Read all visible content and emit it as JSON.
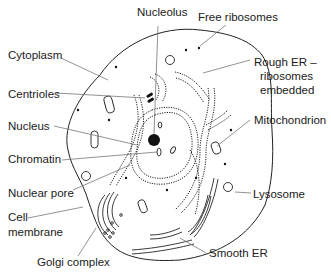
{
  "diagram": {
    "labels": {
      "nucleolus": "Nucleolus",
      "free_ribosomes": "Free ribosomes",
      "cytoplasm": "Cytoplasm",
      "rough_er_line1": "Rough ER –",
      "rough_er_line2": "ribosomes",
      "rough_er_line3": "embedded",
      "centrioles": "Centrioles",
      "nucleus": "Nucleus",
      "mitochondrion": "Mitochondrion",
      "chromatin": "Chromatin",
      "nuclear_pore": "Nuclear pore",
      "lysosome": "Lysosome",
      "cell_membrane_line1": "Cell",
      "cell_membrane_line2": "membrane",
      "golgi_complex": "Golgi complex",
      "smooth_er": "Smooth ER"
    }
  }
}
